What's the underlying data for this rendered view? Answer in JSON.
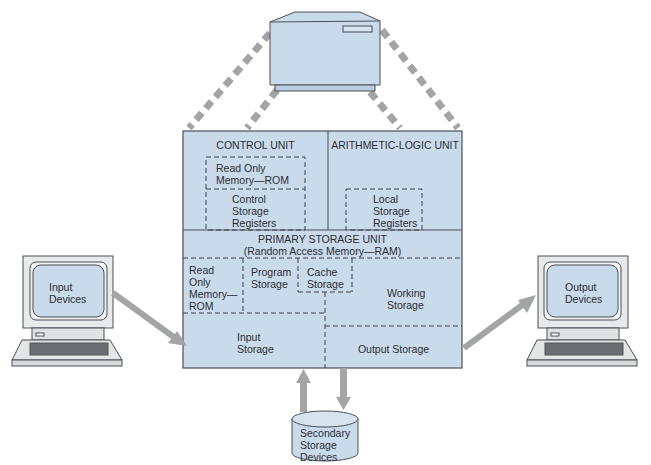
{
  "diagram": {
    "colors": {
      "fill": "#c9dbea",
      "stroke": "#4a4f57",
      "arrow": "#a3a4a6",
      "background": "#ffffff"
    },
    "mainframe": {
      "label": ""
    },
    "cpu": {
      "control_unit": {
        "title": "CONTROL UNIT",
        "rom": "Read Only\nMemory—ROM",
        "registers": "Control\nStorage\nRegisters"
      },
      "alu": {
        "title": "ARITHMETIC-LOGIC UNIT",
        "registers": "Local\nStorage\nRegisters"
      },
      "primary_storage": {
        "title": "PRIMARY STORAGE UNIT",
        "subtitle": "(Random Access Memory—RAM)",
        "rom": "Read\nOnly\nMemory—\nROM",
        "program": "Program\nStorage",
        "cache": "Cache\nStorage",
        "working": "Working\nStorage",
        "input": "Input\nStorage",
        "output": "Output Storage"
      }
    },
    "input_devices": {
      "label": "Input\nDevices"
    },
    "output_devices": {
      "label": "Output\nDevices"
    },
    "secondary_storage": {
      "label": "Secondary\nStorage\nDevices"
    }
  }
}
